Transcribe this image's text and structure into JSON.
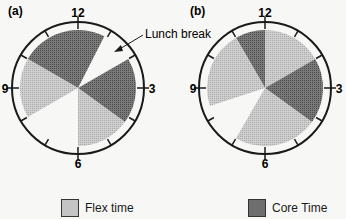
{
  "figure": {
    "panel_a": {
      "label": "(a)",
      "hours": {
        "top": "12",
        "right": "3",
        "bottom": "6",
        "left": "9"
      },
      "annotation": "Lunch break",
      "sectors": [
        {
          "type": "core",
          "from": 10,
          "to": 12.9
        },
        {
          "type": "lunch",
          "from": 12.9,
          "to": 14
        },
        {
          "type": "core",
          "from": 14,
          "to": 16.2
        },
        {
          "type": "flex",
          "from": 16.2,
          "to": 18
        },
        {
          "type": "none",
          "from": 18,
          "to": 20
        },
        {
          "type": "flex",
          "from": 20,
          "to": 22
        }
      ]
    },
    "panel_b": {
      "label": "(b)",
      "hours": {
        "top": "12",
        "right": "3",
        "bottom": "6",
        "left": "9"
      },
      "sectors": [
        {
          "type": "core",
          "from": 11,
          "to": 12
        },
        {
          "type": "flex",
          "from": 12,
          "to": 14
        },
        {
          "type": "core",
          "from": 14,
          "to": 16.2
        },
        {
          "type": "flex",
          "from": 16.2,
          "to": 19
        },
        {
          "type": "none",
          "from": 19,
          "to": 20.4
        },
        {
          "type": "flex",
          "from": 20.4,
          "to": 23
        }
      ]
    },
    "legend": {
      "flex": "Flex time",
      "core": "Core Time"
    },
    "colors": {
      "flex": "#c4c4c4",
      "core": "#6e6e6e",
      "outline": "#1a1a1a",
      "background": "#f7f7f5"
    }
  }
}
